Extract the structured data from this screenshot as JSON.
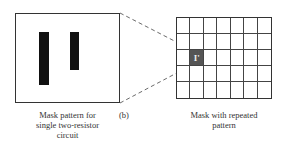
{
  "figure": {
    "panel_label": "(b)",
    "left": {
      "caption_lines": [
        "Mask pattern for",
        "single two-resistor",
        "circuit"
      ],
      "resistors": [
        {
          "name": "resistor-1",
          "x": 39,
          "y": 32,
          "w": 10,
          "h": 53
        },
        {
          "name": "resistor-2",
          "x": 70,
          "y": 32,
          "w": 9,
          "h": 38
        }
      ]
    },
    "right": {
      "caption_lines": [
        "Mask with repeated",
        "pattern"
      ],
      "grid": {
        "columns": 7,
        "rows": 5,
        "highlight_col": 1,
        "highlight_row": 2,
        "highlight_glyph": "I'"
      }
    },
    "colors": {
      "outline": "#333333",
      "resistor": "#111111",
      "highlight": "#555555"
    }
  }
}
